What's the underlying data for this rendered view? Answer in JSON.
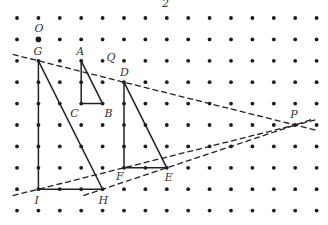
{
  "figure": {
    "title_fragment": "2",
    "grid": {
      "x0": 17,
      "y0": 18,
      "dx": 21.4,
      "dy": 21.4,
      "cols": 15,
      "rows": 10,
      "dot_color": "#1a1a1a"
    },
    "points": {
      "O": {
        "label": "O",
        "col": 1,
        "row": 1
      },
      "G": {
        "label": "G",
        "col": 1,
        "row": 2
      },
      "A": {
        "label": "A",
        "col": 3,
        "row": 2
      },
      "Q": {
        "label": "Q",
        "col": 4,
        "row": 2
      },
      "C": {
        "label": "C",
        "col": 3,
        "row": 4
      },
      "B": {
        "label": "B",
        "col": 4,
        "row": 4
      },
      "D": {
        "label": "D",
        "col": 5,
        "row": 3
      },
      "F": {
        "label": "F",
        "col": 5,
        "row": 7
      },
      "E": {
        "label": "E",
        "col": 7,
        "row": 7
      },
      "I": {
        "label": "I",
        "col": 1,
        "row": 8
      },
      "H": {
        "label": "H",
        "col": 4,
        "row": 8
      },
      "P": {
        "label": "P",
        "col": 13,
        "row": 5
      }
    },
    "triangles": [
      {
        "name": "ABC",
        "vertices": [
          "A",
          "B",
          "C"
        ]
      },
      {
        "name": "DEF",
        "vertices": [
          "D",
          "E",
          "F"
        ]
      },
      {
        "name": "GHI",
        "vertices": [
          "G",
          "H",
          "I"
        ]
      }
    ],
    "dashed_lines": [
      {
        "name": "line-GDP",
        "through": [
          "G",
          "D",
          "P"
        ]
      },
      {
        "name": "line-IFP",
        "through": [
          "I",
          "F",
          "P"
        ]
      },
      {
        "name": "line-HEP",
        "through": [
          "H",
          "E",
          "P"
        ]
      }
    ]
  }
}
